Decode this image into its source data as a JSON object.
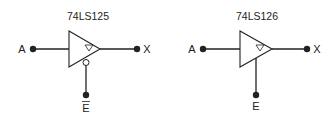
{
  "diagram": {
    "type": "tri-state buffer comparison",
    "colors": {
      "stroke": "#222222",
      "background": "#ffffff"
    },
    "gates": [
      {
        "title": "74LS125",
        "input_label": "A",
        "output_label": "X",
        "enable_label": "E",
        "enable_active_low": true,
        "enable_overbar": true,
        "inner_symbol": "tri-state-triangle"
      },
      {
        "title": "74LS126",
        "input_label": "A",
        "output_label": "X",
        "enable_label": "E",
        "enable_active_low": false,
        "enable_overbar": false,
        "inner_symbol": "tri-state-triangle"
      }
    ]
  }
}
